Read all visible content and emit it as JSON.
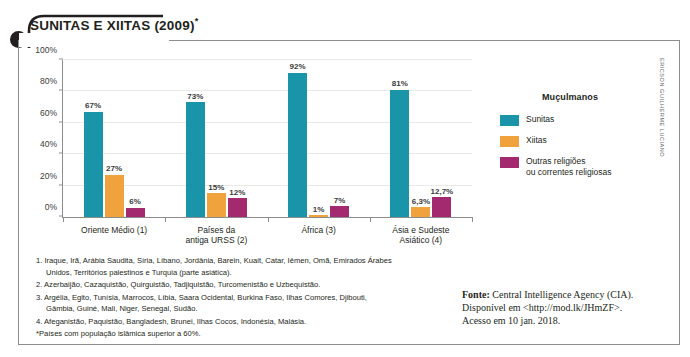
{
  "chart_title": "SUNITAS E XIITAS (2009)",
  "chart_title_mark": "*",
  "legend": {
    "title": "Muçulmanos",
    "items": [
      {
        "label": "Sunitas",
        "color": "#1a94a8"
      },
      {
        "label": "Xiitas",
        "color": "#f0a33c"
      },
      {
        "label": "Outras religiões\nou correntes religiosas",
        "color": "#a32a6e"
      }
    ]
  },
  "notes": [
    "1. Iraque, Irã, Arábia Saudita, Síria, Líbano, Jordânia, Barein, Kuait, Catar, Iêmen, Omã, Emirados Árabes Unidos, Territórios palestinos e Turquia (parte asiática).",
    "2. Azerbaijão, Cazaquistão, Quirguistão, Tadjiquistão, Turcomenistão e Uzbequistão.",
    "3. Argélia, Egito, Tunísia, Marrocos, Líbia, Saara Ocidental, Burkina Faso, Ilhas Comores, Djibouti, Gâmbia, Guiné, Mali, Niger, Senegal, Sudão.",
    "4. Afeganistão, Paquistão, Bangladesh, Brunei, Ilhas Cocos, Indonésia, Malásia."
  ],
  "note_star": "*Países com população islâmica superior a 60%.",
  "source": {
    "label": "Fonte:",
    "text": " Central Intelligence Agency (CIA). Disponível em <http://mod.lk/JHmZF>. Acesso em 10 jan. 2018."
  },
  "credit": "ERICSON GUILHERME LUCIANO",
  "chart_data": {
    "type": "bar",
    "title": "SUNITAS E XIITAS (2009)*",
    "xlabel": "",
    "ylabel": "",
    "ylim": [
      0,
      100
    ],
    "yticks": [
      "0%",
      "20%",
      "40%",
      "60%",
      "80%",
      "100%"
    ],
    "ytick_values": [
      0,
      20,
      40,
      60,
      80,
      100
    ],
    "grid": true,
    "legend_position": "right",
    "categories": [
      "Oriente Médio (1)",
      "Países da\nantiga URSS (2)",
      "África (3)",
      "Ásia e Sudeste\nAsiático (4)"
    ],
    "series": [
      {
        "name": "Sunitas",
        "color": "#1a94a8",
        "values": [
          67,
          73,
          92,
          81
        ],
        "labels": [
          "67%",
          "73%",
          "92%",
          "81%"
        ]
      },
      {
        "name": "Xiitas",
        "color": "#f0a33c",
        "values": [
          27,
          15,
          1,
          6.3
        ],
        "labels": [
          "27%",
          "15%",
          "1%",
          "6,3%"
        ]
      },
      {
        "name": "Outras religiões ou correntes religiosas",
        "color": "#a32a6e",
        "values": [
          6,
          12,
          7,
          12.7
        ],
        "labels": [
          "6%",
          "12%",
          "7%",
          "12,7%"
        ]
      }
    ]
  }
}
